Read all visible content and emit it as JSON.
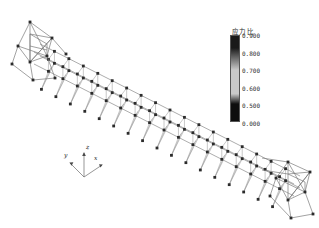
{
  "view": {
    "background_color": "#ffffff",
    "model_line_color": "#7a7a7a",
    "model_dark_line_color": "#4a4a4a",
    "node_marker_color": "#2b2b2b"
  },
  "legend": {
    "title": "应力比",
    "bar_top_color": "#1a1a1a",
    "bar_mid_color": "#c9c9c9",
    "bar_bottom_color": "#0d0d0d",
    "ticks": [
      {
        "label": "0.900",
        "value": 0.9
      },
      {
        "label": "0.800",
        "value": 0.8
      },
      {
        "label": "0.700",
        "value": 0.7
      },
      {
        "label": "0.600",
        "value": 0.6
      },
      {
        "label": "0.500",
        "value": 0.5
      },
      {
        "label": "0.000",
        "value": 0.0
      }
    ]
  },
  "axis_triad": {
    "x_label": "x",
    "y_label": "y",
    "z_label": "z"
  },
  "chart_data": {
    "type": "scatter",
    "title": "应力比",
    "xlabel": "",
    "ylabel": "",
    "colorbar_label": "应力比",
    "colorbar_ticks": [
      "0.900",
      "0.800",
      "0.700",
      "0.600",
      "0.500",
      "0.000"
    ],
    "colorbar_range": [
      0.0,
      0.9
    ],
    "structure": {
      "kind": "3d-truss-gantry",
      "bays": 17,
      "left_tower": true,
      "right_tower": true,
      "axes": [
        "x",
        "y",
        "z"
      ]
    }
  }
}
